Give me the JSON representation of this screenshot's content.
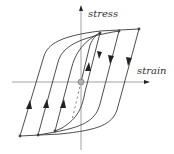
{
  "diagram": {
    "title": "",
    "y_axis_label": "stress",
    "x_axis_label": "strain",
    "colors": {
      "curve": "#3a3a3a",
      "axis": "#8a8a8a",
      "origin_fill": "#b0b0b0",
      "background": "#ffffff"
    },
    "loops": [
      {
        "name": "outer-loop",
        "tip_top": [
          139,
          29
        ],
        "tip_bottom": [
          20,
          136
        ]
      },
      {
        "name": "middle-loop",
        "tip_top": [
          119,
          31
        ],
        "tip_bottom": [
          38,
          135
        ]
      },
      {
        "name": "inner-loop",
        "tip_top": [
          100,
          33
        ],
        "tip_bottom": [
          55,
          131
        ]
      }
    ],
    "origin": [
      81,
      82
    ],
    "initial_loading": "dashed curve from origin"
  }
}
